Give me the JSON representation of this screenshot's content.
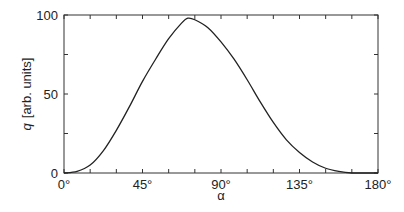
{
  "chart_data": {
    "type": "line",
    "title": "",
    "xlabel": "α",
    "ylabel_var": "q",
    "ylabel_unit": "[arb. units]",
    "xlim": [
      0,
      180
    ],
    "ylim": [
      0,
      100
    ],
    "grid": false,
    "legend": null,
    "x_ticks": [
      0,
      45,
      90,
      135,
      180
    ],
    "x_tick_labels": [
      "0°",
      "45°",
      "90°",
      "135°",
      "180°"
    ],
    "x_minor_step": 15,
    "y_ticks": [
      0,
      50,
      100
    ],
    "y_tick_labels": [
      "0",
      "50",
      "100"
    ],
    "y_minor_step": 25,
    "series": [
      {
        "name": "q(α)",
        "color": "#222222",
        "x": [
          0,
          7.5,
          15,
          22.5,
          30,
          37.5,
          45,
          52.5,
          60,
          67.5,
          71,
          75,
          82.5,
          90,
          97.5,
          105,
          112.5,
          120,
          127.5,
          135,
          142.5,
          150,
          157.5,
          165,
          172.5,
          180
        ],
        "y": [
          0,
          1,
          5,
          14,
          27,
          42,
          58,
          72,
          85,
          95,
          98,
          97,
          92,
          83,
          72,
          59,
          45,
          32,
          21,
          13,
          7,
          3,
          1,
          0,
          0,
          0
        ]
      }
    ]
  }
}
